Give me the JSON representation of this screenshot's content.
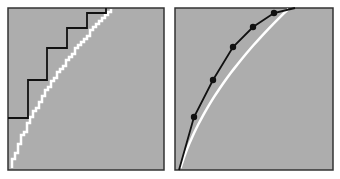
{
  "figure": {
    "colors": {
      "background": "#ffffff",
      "panel_fill": "#adadad",
      "panel_border": "#333333",
      "approx_line": "#111111",
      "true_curve": "#ffffff"
    },
    "panels": [
      {
        "id": "left",
        "type": "step-approximation",
        "frame": {
          "x": 8,
          "y": 8,
          "w": 156,
          "h": 162
        },
        "steps": [
          [
            8,
            118
          ],
          [
            28,
            118
          ],
          [
            28,
            80
          ],
          [
            47,
            80
          ],
          [
            47,
            48
          ],
          [
            67,
            48
          ],
          [
            67,
            28
          ],
          [
            87,
            28
          ],
          [
            87,
            13
          ],
          [
            106,
            13
          ],
          [
            106,
            8
          ]
        ]
      },
      {
        "id": "right",
        "type": "piecewise-linear-approximation",
        "frame": {
          "x": 175,
          "y": 8,
          "w": 158,
          "h": 162
        },
        "line": [
          [
            179,
            170
          ],
          [
            194,
            117
          ],
          [
            213,
            80
          ],
          [
            233,
            47
          ],
          [
            253,
            27
          ],
          [
            274,
            13
          ],
          [
            295,
            8
          ]
        ],
        "points": [
          [
            194,
            117
          ],
          [
            213,
            80
          ],
          [
            233,
            47
          ],
          [
            253,
            27
          ],
          [
            274,
            13
          ]
        ]
      }
    ]
  }
}
